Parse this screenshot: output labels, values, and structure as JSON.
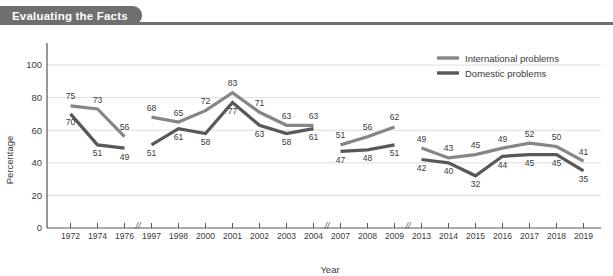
{
  "header": {
    "title": "Evaluating the Facts",
    "bar_color": "#6f6f6f"
  },
  "legend": {
    "position": "top-right",
    "items": [
      {
        "label": "International problems",
        "color": "#868686"
      },
      {
        "label": "Domestic problems",
        "color": "#585858"
      }
    ]
  },
  "axes": {
    "ylabel": "Percentage",
    "xlabel": "Year",
    "yticks": [
      "0",
      "20",
      "40",
      "60",
      "80",
      "100"
    ]
  },
  "chart_data": {
    "type": "line",
    "title": "Evaluating the Facts",
    "xlabel": "Year",
    "ylabel": "Percentage",
    "ylim": [
      0,
      100
    ],
    "grid": true,
    "legend_position": "top-right",
    "axis_breaks": [
      "1976-1997",
      "2004-2007",
      "2009-2013"
    ],
    "categories": [
      "1972",
      "1974",
      "1976",
      "1997",
      "1998",
      "2000",
      "2001",
      "2002",
      "2003",
      "2004",
      "2007",
      "2008",
      "2009",
      "2013",
      "2014",
      "2015",
      "2016",
      "2017",
      "2018",
      "2019"
    ],
    "series": [
      {
        "name": "International problems",
        "color": "#868686",
        "values": [
          75,
          73,
          56,
          68,
          65,
          72,
          83,
          71,
          63,
          63,
          51,
          56,
          62,
          49,
          43,
          45,
          49,
          52,
          50,
          41
        ]
      },
      {
        "name": "Domestic problems",
        "color": "#585858",
        "values": [
          70,
          51,
          49,
          51,
          61,
          58,
          77,
          63,
          58,
          61,
          47,
          48,
          51,
          42,
          40,
          32,
          44,
          45,
          45,
          35
        ]
      }
    ]
  }
}
